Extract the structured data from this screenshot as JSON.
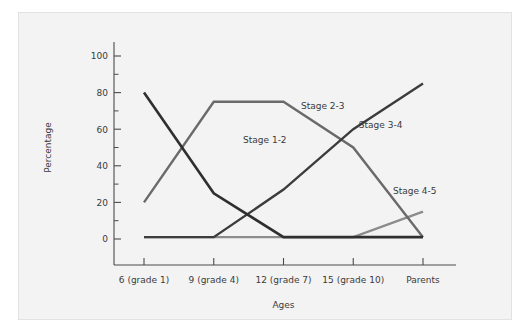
{
  "figure": {
    "background_color": "#f3f3f3",
    "page_color": "#ffffff",
    "border_color": "#e2e2e2"
  },
  "chart_data": {
    "type": "line",
    "title": "",
    "subtitle": "",
    "xlabel": "Ages",
    "ylabel": "Percentage",
    "categories": [
      "6 (grade 1)",
      "9 (grade 4)",
      "12 (grade 7)",
      "15 (grade 10)",
      "Parents"
    ],
    "ylim": [
      0,
      100
    ],
    "xlim": [
      0,
      4
    ],
    "y_major_ticks": [
      0,
      20,
      40,
      60,
      80,
      100
    ],
    "y_minor_ticks": [
      10,
      30,
      50,
      70,
      90
    ],
    "y_tick_labels": [
      "0",
      "20",
      "40",
      "60",
      "80",
      "100"
    ],
    "grid": false,
    "legend_position": "inline-annotations",
    "series": [
      {
        "name": "Stage 1-2",
        "values": [
          80,
          25,
          1,
          1,
          1
        ],
        "color": "#2f2f2f",
        "width": 2.6,
        "label": "Stage 1-2",
        "label_x": 1.42,
        "label_y": 52.5
      },
      {
        "name": "Stage 2-3",
        "values": [
          20,
          75,
          75,
          50,
          1
        ],
        "color": "#6a6a6a",
        "width": 2.4,
        "label": "Stage 2-3",
        "label_x": 2.25,
        "label_y": 71.0
      },
      {
        "name": "Stage 3-4",
        "values": [
          1,
          1,
          27,
          60,
          85
        ],
        "color": "#3c3c3c",
        "width": 2.4,
        "label": "Stage 3-4",
        "label_x": 3.08,
        "label_y": 60.5
      },
      {
        "name": "Stage 4-5",
        "values": [
          1,
          1,
          1,
          1,
          15
        ],
        "color": "#8c8c8c",
        "width": 2.4,
        "label": "Stage 4-5",
        "label_x": 3.57,
        "label_y": 24.5
      }
    ]
  }
}
